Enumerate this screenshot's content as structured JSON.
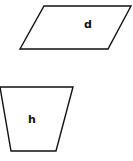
{
  "shapes": [
    {
      "kind": "parallelogram",
      "label": "d"
    },
    {
      "kind": "trapezoid",
      "label": "h"
    }
  ],
  "colors": {
    "stroke": "#111111",
    "fill": "#ffffff",
    "background": "#ffffff"
  }
}
